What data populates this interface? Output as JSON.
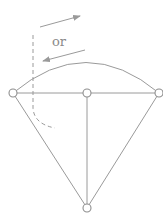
{
  "diagram": {
    "label_or": "or",
    "colors": {
      "line": "#9a9a9a",
      "node_stroke": "#8e8e8e",
      "background": "#ffffff"
    },
    "nodes": [
      {
        "id": "left",
        "x": 13,
        "y": 93
      },
      {
        "id": "center",
        "x": 87,
        "y": 93
      },
      {
        "id": "right",
        "x": 159,
        "y": 93
      },
      {
        "id": "bottom",
        "x": 87,
        "y": 208
      }
    ],
    "edges": [
      {
        "from": "left",
        "to": "right",
        "kind": "straight"
      },
      {
        "from": "left",
        "to": "right",
        "kind": "arc"
      },
      {
        "from": "center",
        "to": "bottom",
        "kind": "straight"
      },
      {
        "from": "left",
        "to": "bottom",
        "kind": "straight"
      },
      {
        "from": "right",
        "to": "bottom",
        "kind": "straight"
      }
    ],
    "arrows": [
      {
        "id": "arrow-right",
        "direction": "right-up"
      },
      {
        "id": "arrow-left",
        "direction": "left-down"
      }
    ],
    "dashed_path": {
      "description": "vertical dashed line curving at bottom"
    }
  }
}
